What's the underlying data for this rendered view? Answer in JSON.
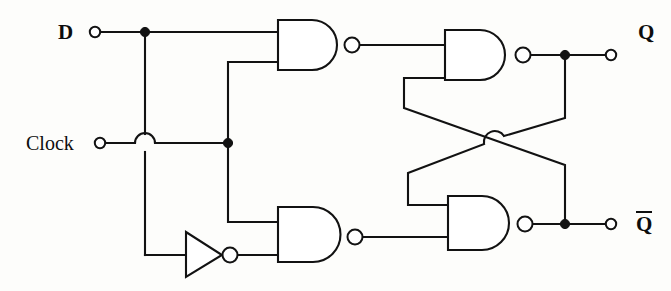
{
  "diagram": {
    "type": "logic-circuit-schematic",
    "background_color": "#fdfdfb",
    "line_color": "#121212"
  },
  "inputs": [
    {
      "id": "d",
      "label": "D",
      "terminal_x": 93,
      "terminal_y": 32
    },
    {
      "id": "clock",
      "label": "Clock",
      "terminal_x": 98,
      "terminal_y": 143
    }
  ],
  "outputs": [
    {
      "id": "q",
      "label": "Q",
      "overline": false,
      "terminal_x": 613,
      "terminal_y": 55
    },
    {
      "id": "qbar",
      "label": "Q",
      "overline": true,
      "terminal_x": 613,
      "terminal_y": 224
    }
  ],
  "gates": [
    {
      "id": "nand1",
      "type": "NAND",
      "name": "upper-input-nand",
      "inputs": [
        "D",
        "Clock"
      ],
      "x": 278,
      "y": 20
    },
    {
      "id": "nand2",
      "type": "NAND",
      "name": "upper-latch-nand",
      "inputs": [
        "nand1",
        "qbar-feedback"
      ],
      "x": 445,
      "y": 30,
      "output": "Q"
    },
    {
      "id": "nand3",
      "type": "NAND",
      "name": "lower-input-nand",
      "inputs": [
        "Clock",
        "not1"
      ],
      "x": 278,
      "y": 207
    },
    {
      "id": "nand4",
      "type": "NAND",
      "name": "lower-latch-nand",
      "inputs": [
        "q-feedback",
        "nand3"
      ],
      "x": 448,
      "y": 196,
      "output": "Qbar"
    },
    {
      "id": "not1",
      "type": "NOT",
      "name": "d-inverter",
      "inputs": [
        "D"
      ],
      "x": 186,
      "y": 255
    }
  ],
  "junctions": [
    {
      "id": "d-branch",
      "x": 145,
      "y": 32
    },
    {
      "id": "clock-branch",
      "x": 228,
      "y": 143
    },
    {
      "id": "q-branch",
      "x": 565,
      "y": 55
    },
    {
      "id": "qbar-branch",
      "x": 565,
      "y": 224
    }
  ],
  "crossover": {
    "id": "feedback-crossover",
    "x": 495,
    "y": 140,
    "style": "hop-arc"
  },
  "wire_hops": [
    {
      "id": "clock-over-d",
      "x": 145,
      "y": 143,
      "style": "hop-arc"
    }
  ]
}
